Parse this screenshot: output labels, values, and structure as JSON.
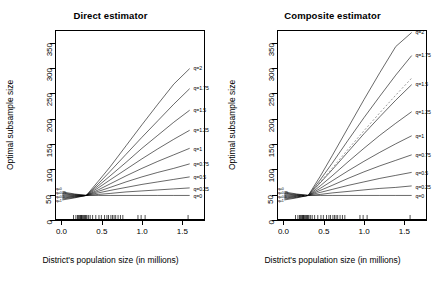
{
  "figure": {
    "width": 443,
    "height": 286,
    "background": "#ffffff",
    "line_color": "#000000",
    "dashed_color": "#555555"
  },
  "chart_data": [
    {
      "type": "line",
      "title": "Direct estimator",
      "xlabel": "District's population size (in millions)",
      "ylabel": "Optimal subsample size",
      "xlim": [
        -0.08,
        1.78
      ],
      "ylim": [
        0,
        375
      ],
      "xticks": [
        0.0,
        0.5,
        1.0,
        1.5
      ],
      "xticklabels": [
        "0.0",
        "0.5",
        "1.0",
        "1.5"
      ],
      "yticks": [
        0,
        50,
        100,
        150,
        200,
        250,
        300,
        350
      ],
      "yticklabels": [
        "0",
        "50",
        "100",
        "150",
        "200",
        "250",
        "300",
        "350"
      ],
      "grid": false,
      "legend": "inline-end-labels",
      "annotations": [
        "q=0",
        "q=0.25",
        "q=0.5",
        "q=0.75",
        "q=1",
        "q=1.25",
        "q=1.5",
        "q=1.75",
        "q=2"
      ],
      "x": [
        0.0,
        0.15,
        0.3,
        0.45,
        0.6,
        0.8,
        1.0,
        1.2,
        1.4,
        1.6
      ],
      "series": [
        {
          "name": "q=0",
          "values": [
            54,
            50,
            47,
            47,
            47,
            47,
            47,
            47,
            47,
            47
          ]
        },
        {
          "name": "q=0.25",
          "values": [
            52,
            49,
            47,
            49,
            51,
            54,
            56,
            58,
            60,
            62
          ]
        },
        {
          "name": "q=0.5",
          "values": [
            50,
            48,
            47,
            52,
            57,
            63,
            69,
            74,
            79,
            84
          ]
        },
        {
          "name": "q=0.75",
          "values": [
            48,
            47,
            47,
            55,
            63,
            74,
            84,
            93,
            101,
            110
          ]
        },
        {
          "name": "q=1",
          "values": [
            46,
            46,
            47,
            58,
            70,
            86,
            101,
            115,
            128,
            141
          ]
        },
        {
          "name": "q=1.25",
          "values": [
            44,
            45,
            47,
            62,
            78,
            99,
            120,
            140,
            159,
            177
          ]
        },
        {
          "name": "q=1.5",
          "values": [
            42,
            44,
            47,
            66,
            86,
            113,
            141,
            167,
            193,
            217
          ]
        },
        {
          "name": "q=1.75",
          "values": [
            40,
            43,
            47,
            70,
            95,
            129,
            163,
            196,
            229,
            260
          ]
        },
        {
          "name": "q=2",
          "values": [
            38,
            42,
            47,
            75,
            104,
            146,
            188,
            229,
            269,
            300
          ]
        }
      ],
      "rug": {
        "label": "rug-ticks",
        "y": 8,
        "x": [
          0.14,
          0.17,
          0.19,
          0.2,
          0.21,
          0.22,
          0.23,
          0.235,
          0.24,
          0.25,
          0.26,
          0.27,
          0.28,
          0.29,
          0.3,
          0.31,
          0.33,
          0.35,
          0.38,
          0.42,
          0.46,
          0.49,
          0.53,
          0.56,
          0.58,
          0.61,
          0.63,
          0.65,
          0.67,
          0.7,
          0.73,
          0.76,
          0.95,
          0.99,
          1.04,
          1.58
        ]
      }
    },
    {
      "type": "line",
      "title": "Composite estimator",
      "xlabel": "District's population size (in millions)",
      "ylabel": "Optimal subsample size",
      "xlim": [
        -0.08,
        1.78
      ],
      "ylim": [
        0,
        375
      ],
      "xticks": [
        0.0,
        0.5,
        1.0,
        1.5
      ],
      "xticklabels": [
        "0.0",
        "0.5",
        "1.0",
        "1.5"
      ],
      "yticks": [
        0,
        50,
        100,
        150,
        200,
        250,
        300,
        350
      ],
      "yticklabels": [
        "0",
        "50",
        "100",
        "150",
        "200",
        "250",
        "300",
        "350"
      ],
      "grid": false,
      "legend": "inline-end-labels",
      "annotations": [
        "q=0",
        "q=0.25",
        "q=0.5",
        "q=0.75",
        "q=1",
        "q=1.25",
        "q=1.5",
        "q=1.75",
        "q=2"
      ],
      "x": [
        0.0,
        0.15,
        0.3,
        0.45,
        0.6,
        0.8,
        1.0,
        1.2,
        1.4,
        1.6
      ],
      "series": [
        {
          "name": "q=0",
          "values": [
            54,
            50,
            47,
            47,
            47,
            47,
            47,
            47,
            47,
            47
          ]
        },
        {
          "name": "q=0.25",
          "values": [
            52,
            49,
            47,
            49,
            52,
            55,
            58,
            61,
            63,
            66
          ]
        },
        {
          "name": "q=0.5",
          "values": [
            50,
            48,
            47,
            53,
            59,
            67,
            74,
            81,
            87,
            93
          ]
        },
        {
          "name": "q=0.75",
          "values": [
            48,
            47,
            47,
            57,
            67,
            81,
            94,
            106,
            117,
            128
          ]
        },
        {
          "name": "q=1",
          "values": [
            46,
            46,
            47,
            61,
            76,
            96,
            115,
            133,
            150,
            166
          ]
        },
        {
          "name": "q=1.25",
          "values": [
            44,
            45,
            47,
            66,
            86,
            114,
            141,
            167,
            191,
            214
          ]
        },
        {
          "name": "q=1.5",
          "values": [
            42,
            44,
            47,
            72,
            98,
            134,
            170,
            204,
            237,
            268
          ]
        },
        {
          "name": "q=1.75",
          "values": [
            40,
            43,
            47,
            78,
            111,
            157,
            202,
            245,
            287,
            326
          ]
        },
        {
          "name": "q=2",
          "values": [
            38,
            42,
            47,
            85,
            126,
            182,
            238,
            292,
            344,
            372
          ]
        }
      ],
      "dashed_series": {
        "name": "reference",
        "values": [
          44,
          45,
          47,
          74,
          101,
          139,
          176,
          212,
          247,
          281
        ],
        "style": "dashed"
      },
      "rug": {
        "label": "rug-ticks",
        "y": 8,
        "x": [
          0.14,
          0.17,
          0.19,
          0.2,
          0.21,
          0.22,
          0.23,
          0.235,
          0.24,
          0.25,
          0.26,
          0.27,
          0.28,
          0.29,
          0.3,
          0.31,
          0.33,
          0.35,
          0.38,
          0.42,
          0.46,
          0.49,
          0.53,
          0.56,
          0.58,
          0.61,
          0.63,
          0.65,
          0.67,
          0.7,
          0.73,
          0.76,
          0.95,
          0.99,
          1.04,
          1.58
        ]
      }
    }
  ],
  "origin_labels": [
    "q=0",
    "q=0.25",
    "q=0.5",
    "q=1"
  ]
}
